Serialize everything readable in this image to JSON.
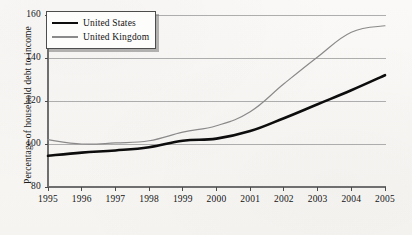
{
  "figure": {
    "background_color": "#f7f6f4",
    "plot_area": {
      "left": 48,
      "right": 385,
      "top": 15,
      "bottom": 187
    }
  },
  "legend": {
    "position": "top-left",
    "entries": [
      {
        "label": "United States",
        "color": "#0d0d0d",
        "style": "thick-solid"
      },
      {
        "label": "United Kingdom",
        "color": "#8a8a8a",
        "style": "thin-solid"
      }
    ]
  },
  "axes": {
    "y_title": "Percentage of household debt to income",
    "y_ticks": [
      "80",
      "100",
      "120",
      "140",
      "160"
    ],
    "x_ticks": [
      "1995",
      "1996",
      "1997",
      "1998",
      "1999",
      "2000",
      "2001",
      "2002",
      "2003",
      "2004",
      "2005"
    ]
  },
  "chart_data": {
    "type": "line",
    "title": "",
    "subtitle": "",
    "xlabel": "",
    "ylabel": "Percentage of household debt to income",
    "x": [
      1995,
      1996,
      1997,
      1998,
      1999,
      2000,
      2001,
      2002,
      2003,
      2004,
      2005
    ],
    "xlim": [
      1995,
      2005
    ],
    "ylim": [
      80,
      160
    ],
    "ytick_values": [
      80,
      100,
      120,
      140,
      160
    ],
    "xtick_labels": [
      "1995",
      "1996",
      "1997",
      "1998",
      "1999",
      "2000",
      "2001",
      "2002",
      "2003",
      "2004",
      "2005"
    ],
    "grid": "horizontal",
    "legend_position": "top-left",
    "series": [
      {
        "name": "United States",
        "color": "#0d0d0d",
        "line_width": 2.6,
        "values": [
          94.5,
          96.0,
          97.0,
          98.5,
          101.5,
          102.5,
          106.0,
          112.0,
          118.5,
          125.0,
          132.0
        ]
      },
      {
        "name": "United Kingdom",
        "color": "#8a8a8a",
        "line_width": 1.2,
        "values": [
          102.0,
          100.0,
          100.5,
          101.5,
          105.5,
          108.5,
          115.0,
          128.0,
          140.5,
          152.0,
          155.0
        ]
      }
    ]
  }
}
